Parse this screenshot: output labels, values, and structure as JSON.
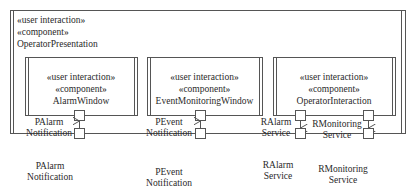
{
  "container": {
    "stereotype1": "«user interaction»",
    "stereotype2": "«component»",
    "name": "OperatorPresentation"
  },
  "components": [
    {
      "stereotype1": "«user interaction»",
      "stereotype2": "«component»",
      "name": "AlarmWindow",
      "inner_port_label": [
        "PAlarm",
        "Notification"
      ],
      "outer_port_label": [
        "PAlarm",
        "Notification"
      ],
      "direction": "in"
    },
    {
      "stereotype1": "«user interaction»",
      "stereotype2": "«component»",
      "name": "EventMonitoringWindow",
      "inner_port_label": [
        "PEvent",
        "Notification"
      ],
      "outer_port_label": [
        "PEvent",
        "Notification"
      ],
      "direction": "in"
    },
    {
      "stereotype1": "«user interaction»",
      "stereotype2": "«component»",
      "name": "OperatorInteraction",
      "ports": [
        {
          "inner_port_label": [
            "RAlarm",
            "Service"
          ],
          "outer_port_label": [
            "RAlarm",
            "Service"
          ],
          "direction": "out"
        },
        {
          "inner_port_label": [
            "RMonitoring",
            "Service"
          ],
          "outer_port_label": [
            "RMonitoring",
            "Service"
          ],
          "direction": "out"
        }
      ]
    }
  ],
  "colors": {
    "line": "#555555",
    "text": "#2a2a2a",
    "background": "#ffffff"
  }
}
